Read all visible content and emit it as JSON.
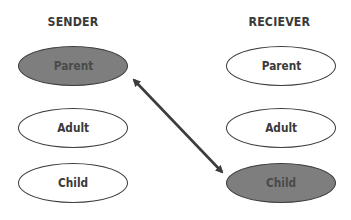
{
  "sender": {
    "heading": "SENDER",
    "nodes": [
      {
        "label": "Parent",
        "highlighted": true
      },
      {
        "label": "Adult",
        "highlighted": false
      },
      {
        "label": "Child",
        "highlighted": false
      }
    ]
  },
  "receiver": {
    "heading": "RECIEVER",
    "nodes": [
      {
        "label": "Parent",
        "highlighted": false
      },
      {
        "label": "Adult",
        "highlighted": false
      },
      {
        "label": "Child",
        "highlighted": true
      }
    ]
  },
  "connection": {
    "from": "sender.Parent",
    "to": "receiver.Child",
    "type": "bidirectional-arrow"
  },
  "colors": {
    "highlight_fill": "#7e7e7e",
    "stroke": "#3c3c3c",
    "text": "#3a3a3a",
    "background": "#ffffff"
  }
}
